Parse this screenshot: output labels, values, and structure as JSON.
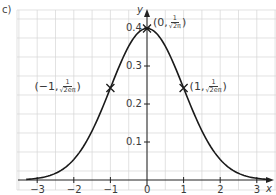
{
  "part_label": "c)",
  "chart_data": {
    "type": "line",
    "title": "",
    "function": "y = (1/sqrt(2π)) e^(-x^2/2)",
    "xlabel": "x",
    "ylabel": "y",
    "xlim": [
      -3.3,
      3.3
    ],
    "ylim": [
      0,
      0.45
    ],
    "x_ticks": [
      -3,
      -2,
      -1,
      0,
      1,
      2,
      3
    ],
    "x_tick_labels": [
      "−3",
      "−2",
      "−1",
      "0",
      "1",
      "2",
      "3"
    ],
    "y_ticks": [
      0.1,
      0.2,
      0.3,
      0.4
    ],
    "y_tick_labels": [
      "0.1",
      "0.2",
      "0.3",
      "0.4"
    ],
    "grid": true,
    "grid_step": {
      "x": 0.5,
      "y": 0.05
    },
    "series": [
      {
        "name": "normal curve",
        "x": [
          -3.3,
          -3,
          -2.5,
          -2,
          -1.5,
          -1,
          -0.5,
          0,
          0.5,
          1,
          1.5,
          2,
          2.5,
          3,
          3.3
        ],
        "values": [
          0.0017,
          0.0044,
          0.0175,
          0.054,
          0.1295,
          0.242,
          0.3521,
          0.3989,
          0.3521,
          0.242,
          0.1295,
          0.054,
          0.0175,
          0.0044,
          0.0017
        ]
      }
    ],
    "annotations": [
      {
        "x": 0,
        "y": 0.3989,
        "marker": "cross",
        "label_prefix": "(0, ",
        "label_frac_num": "1",
        "label_frac_den": "√2π",
        "label_suffix": ")"
      },
      {
        "x": -1,
        "y": 0.242,
        "marker": "cross",
        "label_prefix": "(−1, ",
        "label_frac_num": "1",
        "label_frac_den": "√2eπ",
        "label_suffix": ")"
      },
      {
        "x": 1,
        "y": 0.242,
        "marker": "cross",
        "label_prefix": "(1, ",
        "label_frac_num": "1",
        "label_frac_den": "√2eπ",
        "label_suffix": ")"
      }
    ]
  }
}
